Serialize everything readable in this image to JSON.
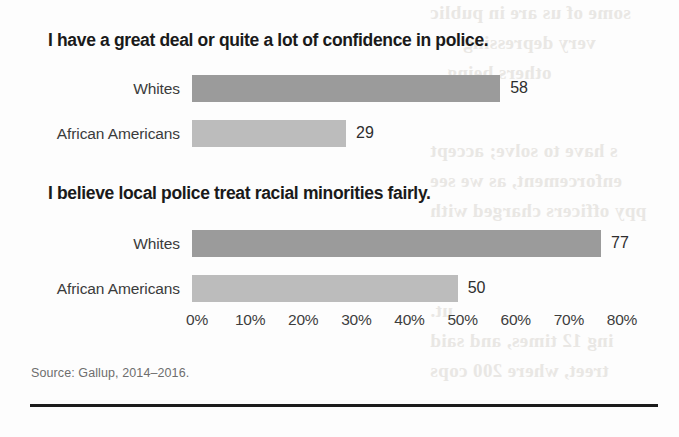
{
  "figure": {
    "source_note": "Source: Gallup, 2014–2016.",
    "rule_color": "#1b1b1b",
    "background_color": "#fdfdfd"
  },
  "ghost_text": [
    {
      "text": "some of us are in public",
      "x": 430,
      "y": 2
    },
    {
      "text": "very depressing",
      "x": 463,
      "y": 32
    },
    {
      "text": "others being",
      "x": 447,
      "y": 62
    },
    {
      "text": "s have to solve; accept",
      "x": 430,
      "y": 140
    },
    {
      "text": "enforcement, as we see",
      "x": 430,
      "y": 170
    },
    {
      "text": "ppy officers charged with",
      "x": 430,
      "y": 200
    },
    {
      "text": "ut.",
      "x": 430,
      "y": 300
    },
    {
      "text": "ing 12 times, and said",
      "x": 430,
      "y": 330
    },
    {
      "text": "treet, where 200 cops",
      "x": 430,
      "y": 360
    }
  ],
  "chart_data": {
    "type": "bar",
    "orientation": "horizontal",
    "title": "",
    "xlabel": "",
    "ylabel": "",
    "xlim": [
      0,
      80
    ],
    "grid": false,
    "legend": "none",
    "axis": {
      "tick_labels": [
        "0%",
        "10%",
        "20%",
        "30%",
        "40%",
        "50%",
        "60%",
        "70%",
        "80%"
      ],
      "tick_values": [
        0,
        10,
        20,
        30,
        40,
        50,
        60,
        70,
        80
      ]
    },
    "colors": {
      "whites_bar": "#9b9b9b",
      "african_americans_bar": "#bcbcbc",
      "title_text": "#1a1a1a",
      "label_text": "#3b3b3b"
    },
    "panels": [
      {
        "title": "I have a great deal or quite a lot of confidence in police.",
        "categories": [
          "Whites",
          "African Americans"
        ],
        "values": [
          58,
          29
        ],
        "value_labels": [
          "58",
          "29"
        ]
      },
      {
        "title": "I believe local police treat racial minorities fairly.",
        "categories": [
          "Whites",
          "African Americans"
        ],
        "values": [
          77,
          50
        ],
        "value_labels": [
          "77",
          "50"
        ]
      }
    ]
  }
}
